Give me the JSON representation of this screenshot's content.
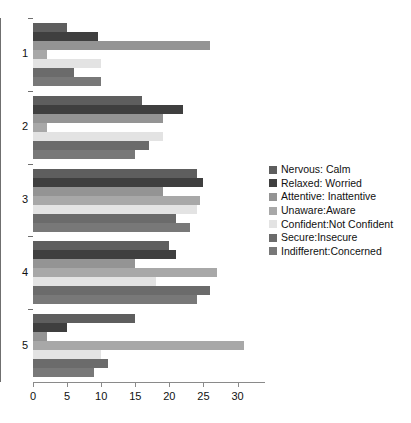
{
  "chart_data": {
    "type": "bar",
    "orientation": "horizontal",
    "title": "",
    "xlabel": "",
    "ylabel": "",
    "categories": [
      "1",
      "2",
      "3",
      "4",
      "5"
    ],
    "xlim": [
      0,
      33
    ],
    "ylim": [
      0,
      5
    ],
    "xticks": [
      0,
      5,
      10,
      15,
      20,
      25,
      30
    ],
    "xtick_labels": [
      "0",
      "5",
      "10",
      "15",
      "20",
      "25",
      "30"
    ],
    "ytick_labels": [
      "1",
      "2",
      "3",
      "4",
      "5"
    ],
    "grid": false,
    "legend_position": "right",
    "series": [
      {
        "name": "Nervous: Calm",
        "color": "#5e5e5e",
        "values": [
          5,
          16,
          24,
          20,
          15
        ]
      },
      {
        "name": "Relaxed: Worried",
        "color": "#3f3f3f",
        "values": [
          9.5,
          22,
          25,
          21,
          5
        ]
      },
      {
        "name": "Attentive: Inattentive",
        "color": "#949494",
        "values": [
          26,
          19,
          19,
          15,
          2
        ]
      },
      {
        "name": "Unaware:Aware",
        "color": "#a8a8a8",
        "values": [
          2,
          2,
          24.5,
          27,
          31
        ]
      },
      {
        "name": "Confident:Not Confident",
        "color": "#e3e3e3",
        "values": [
          10,
          19,
          24,
          18,
          10
        ]
      },
      {
        "name": "Secure:Insecure",
        "color": "#6b6b6b",
        "values": [
          6,
          17,
          21,
          26,
          11
        ]
      },
      {
        "name": "Indifferent:Concerned",
        "color": "#787878",
        "values": [
          10,
          15,
          23,
          24,
          9
        ]
      }
    ]
  }
}
